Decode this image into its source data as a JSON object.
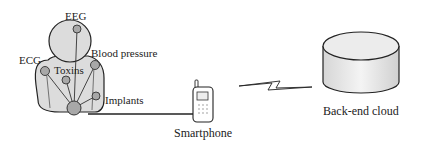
{
  "diagram": {
    "body_sensors": {
      "eeg": "EEG",
      "ecg": "ECG",
      "blood_pressure": "Blood pressure",
      "toxins": "Toxins",
      "implants": "Implants"
    },
    "smartphone_label": "Smartphone",
    "cloud_label": "Back-end cloud",
    "colors": {
      "body_fill": "#dcdcdc",
      "sensor_fill": "#a8a8a8",
      "outline": "#222222"
    }
  }
}
